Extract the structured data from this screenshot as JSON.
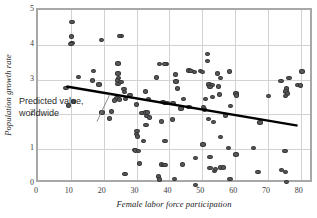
{
  "chart_data": {
    "type": "scatter",
    "title": "",
    "xlabel": "Female labor force participation",
    "ylabel": "Population growth rate",
    "xlim": [
      0,
      84
    ],
    "ylim": [
      0,
      5
    ],
    "xticks": [
      0,
      10,
      20,
      30,
      40,
      50,
      60,
      70,
      80
    ],
    "yticks": [
      0,
      1,
      2,
      3,
      4,
      5
    ],
    "grid": true,
    "legend": "none",
    "marker_color": "#59595b",
    "marker_edge_color": "#333335",
    "gridline_color": "#d2d2d2",
    "frame_color": "#a8a8a8",
    "trendline_color": "#000000",
    "annotations": [
      {
        "name": "predicted-value-annotation",
        "text": "Predicted value,\nworldwide",
        "x": 10.5,
        "y": 1.25,
        "leader_from": [
          18.0,
          1.72
        ],
        "leader_to": [
          22.0,
          2.52
        ]
      }
    ],
    "trendline": {
      "name": "predicted value, worldwide",
      "x": [
        8.5,
        80.5
      ],
      "y": [
        2.75,
        1.6
      ]
    },
    "series": [
      {
        "name": "Countries",
        "points": [
          [
            10.3,
            4.66
          ],
          [
            10.2,
            4.24
          ],
          [
            10.3,
            4.06
          ],
          [
            10.0,
            4.02
          ],
          [
            19.3,
            4.14
          ],
          [
            25.2,
            4.25
          ],
          [
            24.8,
            4.25
          ],
          [
            51.5,
            3.74
          ],
          [
            51.6,
            3.54
          ],
          [
            24.3,
            3.46
          ],
          [
            36.9,
            3.44
          ],
          [
            39.0,
            3.45
          ],
          [
            38.6,
            3.44
          ],
          [
            58.2,
            3.23
          ],
          [
            16.8,
            3.24
          ],
          [
            24.4,
            3.17
          ],
          [
            24.5,
            3.05
          ],
          [
            41.8,
            3.15
          ],
          [
            45.9,
            3.26
          ],
          [
            46.6,
            3.25
          ],
          [
            47.6,
            3.22
          ],
          [
            49.4,
            3.24
          ],
          [
            50.0,
            3.22
          ],
          [
            54.6,
            3.18
          ],
          [
            55.6,
            3.05
          ],
          [
            12.3,
            3.08
          ],
          [
            16.5,
            2.97
          ],
          [
            36.1,
            3.06
          ],
          [
            42.0,
            2.95
          ],
          [
            74.0,
            2.96
          ],
          [
            76.4,
            3.05
          ],
          [
            80.4,
            3.23
          ],
          [
            24.2,
            2.97
          ],
          [
            25.3,
            2.93
          ],
          [
            24.3,
            2.88
          ],
          [
            18.6,
            2.86
          ],
          [
            52.0,
            2.86
          ],
          [
            53.0,
            2.85
          ],
          [
            52.4,
            2.78
          ],
          [
            55.0,
            2.8
          ],
          [
            79.0,
            2.84
          ],
          [
            79.8,
            2.83
          ],
          [
            75.6,
            2.74
          ],
          [
            75.5,
            2.66
          ],
          [
            76.0,
            2.6
          ],
          [
            75.3,
            2.53
          ],
          [
            8.5,
            2.76
          ],
          [
            26.2,
            2.73
          ],
          [
            32.7,
            2.66
          ],
          [
            60.3,
            2.6
          ],
          [
            60.5,
            2.54
          ],
          [
            70.2,
            2.53
          ],
          [
            26.4,
            2.64
          ],
          [
            28.0,
            2.55
          ],
          [
            24.0,
            2.46
          ],
          [
            24.8,
            2.43
          ],
          [
            26.6,
            2.45
          ],
          [
            23.3,
            2.4
          ],
          [
            33.7,
            2.44
          ],
          [
            38.0,
            2.36
          ],
          [
            38.7,
            2.32
          ],
          [
            39.4,
            2.33
          ],
          [
            41.1,
            2.33
          ],
          [
            44.3,
            2.44
          ],
          [
            46.0,
            2.22
          ],
          [
            51.0,
            2.45
          ],
          [
            50.7,
            2.14
          ],
          [
            53.1,
            2.5
          ],
          [
            55.2,
            2.57
          ],
          [
            50.3,
            2.22
          ],
          [
            30.0,
            2.28
          ],
          [
            31.6,
            2.04
          ],
          [
            32.8,
            2.05
          ],
          [
            33.1,
            1.95
          ],
          [
            33.4,
            2.05
          ],
          [
            34.0,
            1.91
          ],
          [
            57.0,
            1.97
          ],
          [
            58.6,
            2.24
          ],
          [
            9.2,
            2.26
          ],
          [
            10.8,
            2.37
          ],
          [
            19.5,
            2.06
          ],
          [
            22.4,
            2.08
          ],
          [
            42.4,
            2.75
          ],
          [
            43.5,
            2.17
          ],
          [
            51.8,
            1.87
          ],
          [
            53.5,
            1.78
          ],
          [
            67.6,
            1.77
          ],
          [
            21.8,
            1.88
          ],
          [
            32.9,
            1.7
          ],
          [
            37.5,
            1.8
          ],
          [
            41.0,
            1.85
          ],
          [
            30.1,
            1.52
          ],
          [
            29.9,
            1.44
          ],
          [
            30.2,
            1.36
          ],
          [
            32.1,
            1.24
          ],
          [
            38.7,
            1.23
          ],
          [
            50.2,
            1.13
          ],
          [
            55.6,
            1.35
          ],
          [
            58.0,
            1.04
          ],
          [
            65.6,
            1.03
          ],
          [
            75.2,
            0.95
          ],
          [
            29.4,
            0.98
          ],
          [
            29.7,
            0.96
          ],
          [
            30.6,
            0.94
          ],
          [
            48.0,
            0.75
          ],
          [
            52.3,
            0.77
          ],
          [
            60.3,
            0.85
          ],
          [
            30.9,
            0.59
          ],
          [
            37.5,
            0.56
          ],
          [
            38.4,
            0.55
          ],
          [
            38.7,
            0.54
          ],
          [
            44.0,
            0.56
          ],
          [
            52.4,
            0.46
          ],
          [
            53.8,
            0.37
          ],
          [
            54.0,
            0.44
          ],
          [
            55.6,
            0.47
          ],
          [
            56.5,
            0.47
          ],
          [
            26.5,
            0.28
          ],
          [
            36.7,
            0.22
          ],
          [
            36.9,
            0.13
          ],
          [
            41.6,
            0.15
          ],
          [
            58.4,
            0.14
          ],
          [
            67.0,
            0.35
          ],
          [
            74.1,
            0.41
          ],
          [
            75.3,
            0.34
          ],
          [
            75.6,
            0.05
          ],
          [
            47.9,
            -0.02
          ]
        ]
      }
    ]
  }
}
